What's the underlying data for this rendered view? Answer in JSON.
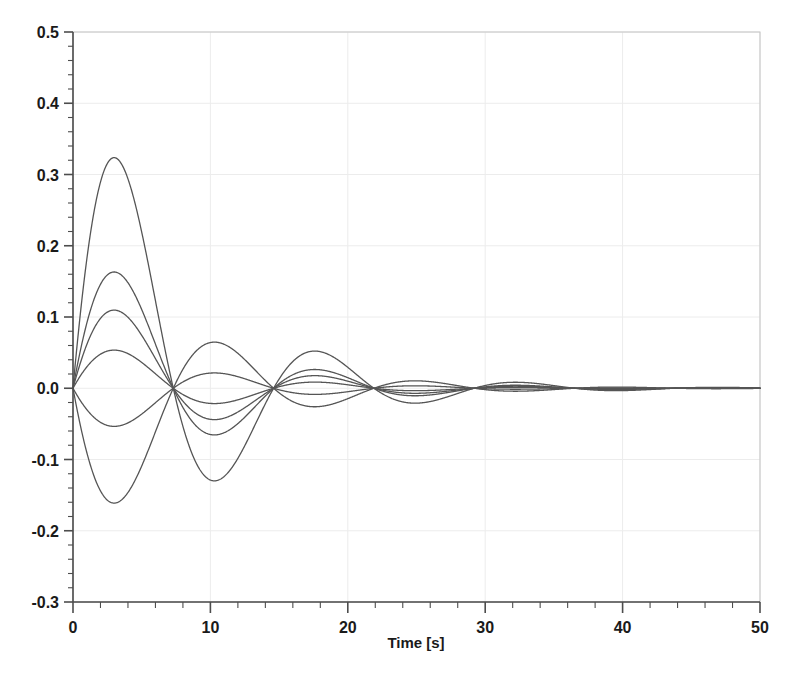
{
  "chart_data": {
    "type": "line",
    "title": "",
    "subtitle": "",
    "xlabel": "Time [s]",
    "ylabel": "",
    "xlim": [
      0,
      50
    ],
    "ylim": [
      -0.3,
      0.5
    ],
    "xticks": [
      0,
      10,
      20,
      30,
      40,
      50
    ],
    "xtick_labels": [
      "0",
      "10",
      "20",
      "30",
      "40",
      "50"
    ],
    "yticks": [
      -0.3,
      -0.2,
      -0.1,
      0.0,
      0.1,
      0.2,
      0.3,
      0.4,
      0.5
    ],
    "ytick_labels": [
      "-0.3",
      "-0.2",
      "-0.1",
      "0.0",
      "0.1",
      "0.2",
      "0.3",
      "0.4",
      "0.5"
    ],
    "minor_ticks_per_major_x": 5,
    "minor_ticks_per_major_y": 5,
    "grid": true,
    "grid_color": "#ececec",
    "legend": false,
    "legend_position": "none",
    "annotations": [],
    "line_color": "#555555",
    "line_width": 1.3,
    "common_period": 14.6,
    "damping_time_constant": 8.0,
    "series": [
      {
        "name": "mode-1",
        "amplitude": 0.49,
        "sign": 1,
        "peaks_t": [
          3.65,
          10.95,
          18.25,
          25.55,
          32.85,
          40.15,
          47.45
        ],
        "peaks_y": [
          0.49,
          -0.243,
          0.118,
          -0.056,
          0.026,
          -0.012,
          0.006
        ]
      },
      {
        "name": "mode-2",
        "amplitude": 0.247,
        "sign": 1,
        "peaks_t": [
          3.65,
          10.95,
          18.25,
          25.55,
          32.85,
          40.15,
          47.45
        ],
        "peaks_y": [
          0.247,
          -0.122,
          0.06,
          -0.028,
          0.013,
          -0.006,
          0.003
        ]
      },
      {
        "name": "mode-3",
        "amplitude": 0.166,
        "sign": 1,
        "peaks_t": [
          3.65,
          10.95,
          18.25,
          25.55,
          32.85,
          40.15,
          47.45
        ],
        "peaks_y": [
          0.166,
          -0.082,
          0.04,
          -0.019,
          0.009,
          -0.004,
          0.002
        ]
      },
      {
        "name": "mode-4",
        "amplitude": 0.081,
        "sign": 1,
        "peaks_t": [
          3.65,
          10.95,
          18.25,
          25.55,
          32.85,
          40.15,
          47.45
        ],
        "peaks_y": [
          0.081,
          -0.04,
          0.02,
          -0.009,
          0.004,
          -0.002,
          0.001
        ]
      },
      {
        "name": "mode-5",
        "amplitude": 0.081,
        "sign": -1,
        "peaks_t": [
          3.65,
          10.95,
          18.25,
          25.55,
          32.85,
          40.15,
          47.45
        ],
        "peaks_y": [
          -0.079,
          0.039,
          -0.019,
          0.009,
          -0.004,
          0.002,
          -0.001
        ]
      },
      {
        "name": "mode-6",
        "amplitude": 0.244,
        "sign": -1,
        "peaks_t": [
          3.65,
          10.95,
          18.25,
          25.55,
          32.85,
          40.15,
          47.45
        ],
        "peaks_y": [
          -0.244,
          0.12,
          -0.059,
          0.028,
          -0.013,
          0.006,
          -0.003
        ]
      }
    ]
  },
  "figure": {
    "plot_left_px": 73,
    "plot_top_px": 32,
    "plot_right_px": 760,
    "plot_bottom_px": 602,
    "background": "#ffffff",
    "frame_color": "#b8b8b8",
    "axis_color": "#4d4d4d"
  }
}
